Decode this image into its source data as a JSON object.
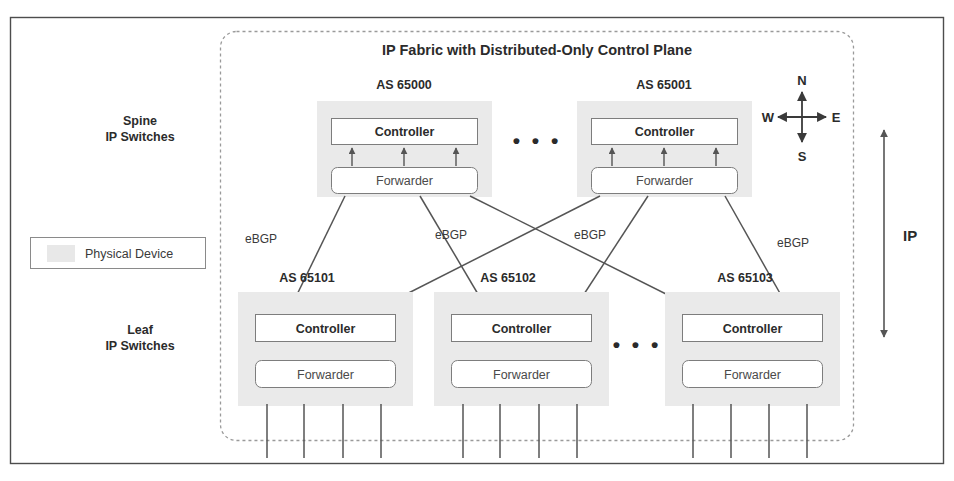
{
  "diagram": {
    "title": "IP Fabric with Distributed-Only Control Plane",
    "outer_frame": {
      "name": "figure-border"
    },
    "fabric_boundary": {
      "style": "dashed-rounded"
    },
    "side_labels": {
      "spine": {
        "line1": "Spine",
        "line2": "IP Switches"
      },
      "leaf": {
        "line1": "Leaf",
        "line2": "IP Switches"
      }
    },
    "legend": {
      "swatch_color": "#e8e8e8",
      "label": "Physical Device"
    },
    "compass": {
      "north": "N",
      "south": "S",
      "east": "E",
      "west": "W"
    },
    "scope_arrow": {
      "label": "IP"
    },
    "ellipsis_symbol": "• • •",
    "spine_layer": {
      "ellipsis": "• • •",
      "devices": [
        {
          "as_label": "AS 65000",
          "controller": "Controller",
          "forwarder": "Forwarder"
        },
        {
          "as_label": "AS 65001",
          "controller": "Controller",
          "forwarder": "Forwarder"
        }
      ]
    },
    "leaf_layer": {
      "ellipsis": "• • •",
      "devices": [
        {
          "as_label": "AS 65101",
          "controller": "Controller",
          "forwarder": "Forwarder"
        },
        {
          "as_label": "AS 65102",
          "controller": "Controller",
          "forwarder": "Forwarder"
        },
        {
          "as_label": "AS 65103",
          "controller": "Controller",
          "forwarder": "Forwarder"
        }
      ]
    },
    "links": {
      "protocol_labels": [
        "eBGP",
        "eBGP",
        "eBGP",
        "eBGP"
      ]
    },
    "colors": {
      "line": "#555555",
      "device_bg": "#eaeaea",
      "box_border": "#8a8a8a",
      "text": "#3a3a3a",
      "text_bold": "#2b2b2b",
      "frame": "#4d4d4d"
    }
  }
}
